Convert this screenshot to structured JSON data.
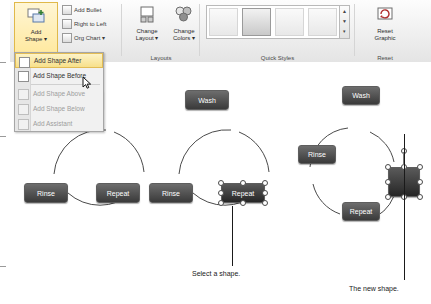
{
  "ribbon": {
    "groups": [
      {
        "id": "create_graphic",
        "label": "Create Graphic"
      },
      {
        "id": "layouts",
        "label": "Layouts"
      },
      {
        "id": "quick_styles",
        "label": "Quick Styles"
      },
      {
        "id": "reset",
        "label": "Reset"
      }
    ],
    "add_shape": {
      "label_line1": "Add",
      "label_line2": "Shape",
      "dropdown": "▾"
    },
    "small_buttons": [
      {
        "id": "add_bullet",
        "label": "Add Bullet"
      },
      {
        "id": "right_to_left",
        "label": "Right to Left"
      },
      {
        "id": "org_chart",
        "label": "Org Chart ▾"
      }
    ],
    "change_layout": {
      "line1": "Change",
      "line2": "Layout ▾"
    },
    "change_colors": {
      "line1": "Change",
      "line2": "Colors ▾"
    },
    "reset_graphic": {
      "line1": "Reset",
      "line2": "Graphic"
    },
    "quick_styles_scroll": {
      "up": "▲",
      "down": "▼",
      "more": "▾"
    }
  },
  "menu": {
    "items": [
      {
        "id": "add_shape_after",
        "label": "Add Shape After",
        "state": "highlighted"
      },
      {
        "id": "add_shape_before",
        "label": "Add Shape Before",
        "state": "normal"
      },
      {
        "id": "add_shape_above",
        "label": "Add Shape Above",
        "state": "disabled"
      },
      {
        "id": "add_shape_below",
        "label": "Add Shape Below",
        "state": "disabled"
      },
      {
        "id": "add_assistant",
        "label": "Add Assistant",
        "state": "disabled"
      }
    ]
  },
  "diagrams": [
    {
      "id": "diagram_left",
      "nodes": [
        {
          "id": "wash",
          "label": "Wash"
        },
        {
          "id": "rinse",
          "label": "Rinse"
        },
        {
          "id": "repeat",
          "label": "Repeat"
        }
      ]
    },
    {
      "id": "diagram_middle",
      "nodes": [
        {
          "id": "wash",
          "label": "Wash"
        },
        {
          "id": "rinse",
          "label": "Rinse"
        },
        {
          "id": "repeat",
          "label": "Repeat",
          "selected": true
        }
      ]
    },
    {
      "id": "diagram_right",
      "nodes": [
        {
          "id": "wash",
          "label": "Wash"
        },
        {
          "id": "rinse",
          "label": "Rinse"
        },
        {
          "id": "repeat",
          "label": "Repeat"
        },
        {
          "id": "new_shape",
          "label": "",
          "selected": true
        }
      ]
    }
  ],
  "captions": [
    {
      "id": "select_a_shape",
      "text": "Select a shape."
    },
    {
      "id": "the_new_shape",
      "text": "The new shape."
    }
  ]
}
